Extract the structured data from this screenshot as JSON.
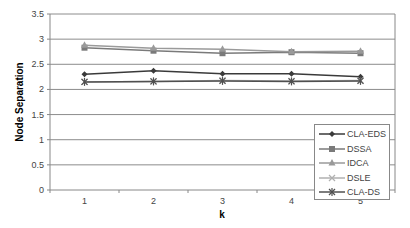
{
  "chart_data": {
    "type": "line",
    "title": "",
    "xlabel": "k",
    "ylabel": "Node Separation",
    "categories": [
      "1",
      "2",
      "3",
      "4",
      "5"
    ],
    "ylim": [
      0,
      3.5
    ],
    "yticks": [
      "0",
      "0.5",
      "1",
      "1.5",
      "2",
      "2.5",
      "3",
      "3.5"
    ],
    "grid": true,
    "legend_position": "lower-right-inside",
    "series": [
      {
        "name": "CLA-EDS",
        "marker": "diamond",
        "color": "#3a3a3a",
        "values": [
          2.3,
          2.37,
          2.31,
          2.31,
          2.25
        ]
      },
      {
        "name": "DSSA",
        "marker": "square",
        "color": "#7a7a7a",
        "values": [
          2.83,
          2.77,
          2.72,
          2.74,
          2.72
        ]
      },
      {
        "name": "IDCA",
        "marker": "triangle",
        "color": "#9a9a9a",
        "values": [
          2.88,
          2.82,
          2.8,
          2.75,
          2.76
        ]
      },
      {
        "name": "DSLE",
        "marker": "x",
        "color": "#b0b0b0",
        "values": [
          2.15,
          2.16,
          2.18,
          2.17,
          2.18
        ]
      },
      {
        "name": "CLA-DS",
        "marker": "star",
        "color": "#505050",
        "values": [
          2.15,
          2.16,
          2.17,
          2.16,
          2.17
        ]
      }
    ]
  }
}
